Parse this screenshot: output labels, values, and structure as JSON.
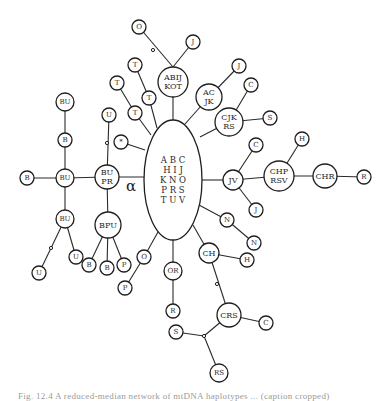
{
  "diagram": {
    "center": {
      "id": "center",
      "cx": 173,
      "cy": 180,
      "rx": 29,
      "ry": 60,
      "lines": [
        "A B C",
        "H I J",
        "K N O",
        "P R S",
        "T U V"
      ]
    },
    "alpha_label": {
      "text": "α",
      "x": 126,
      "y": 191
    },
    "nodes": [
      {
        "id": "abijkot",
        "x": 173,
        "y": 82,
        "r": 15,
        "label": [
          "ABIJ",
          "KOT"
        ]
      },
      {
        "id": "o_top",
        "x": 139,
        "y": 27,
        "r": 7,
        "label": [
          "O"
        ]
      },
      {
        "id": "j_top",
        "x": 193,
        "y": 42,
        "r": 7,
        "label": [
          "J"
        ]
      },
      {
        "id": "acjk",
        "x": 209,
        "y": 97,
        "r": 13,
        "label": [
          "AC",
          "JK"
        ]
      },
      {
        "id": "j_acjk",
        "x": 239,
        "y": 66,
        "r": 7,
        "label": [
          "J"
        ]
      },
      {
        "id": "cjkrs",
        "x": 229,
        "y": 122,
        "r": 14,
        "label": [
          "CJK",
          "RS"
        ]
      },
      {
        "id": "c_cjkrs",
        "x": 251,
        "y": 85,
        "r": 7,
        "label": [
          "C"
        ]
      },
      {
        "id": "s_cjkrs",
        "x": 270,
        "y": 118,
        "r": 7,
        "label": [
          "S"
        ]
      },
      {
        "id": "t1",
        "x": 135,
        "y": 65,
        "r": 7,
        "label": [
          "T"
        ]
      },
      {
        "id": "t2",
        "x": 117,
        "y": 83,
        "r": 7,
        "label": [
          "T"
        ]
      },
      {
        "id": "t3",
        "x": 149,
        "y": 98,
        "r": 7,
        "label": [
          "T"
        ]
      },
      {
        "id": "t4",
        "x": 135,
        "y": 113,
        "r": 7,
        "label": [
          "T"
        ]
      },
      {
        "id": "star",
        "x": 121,
        "y": 142,
        "r": 7,
        "label": [
          "*"
        ]
      },
      {
        "id": "bupr",
        "x": 107,
        "y": 177,
        "r": 12,
        "label": [
          "BU",
          "PR"
        ]
      },
      {
        "id": "u_bupr",
        "x": 109,
        "y": 115,
        "r": 7,
        "label": [
          "U"
        ]
      },
      {
        "id": "bu_mid",
        "x": 65,
        "y": 178,
        "r": 9,
        "label": [
          "BU"
        ]
      },
      {
        "id": "b_left",
        "x": 27,
        "y": 178,
        "r": 7,
        "label": [
          "B"
        ]
      },
      {
        "id": "b_up",
        "x": 65,
        "y": 140,
        "r": 7,
        "label": [
          "B"
        ]
      },
      {
        "id": "bu_top",
        "x": 65,
        "y": 102,
        "r": 9,
        "label": [
          "BU"
        ]
      },
      {
        "id": "bu_bot",
        "x": 65,
        "y": 219,
        "r": 9,
        "label": [
          "BU"
        ]
      },
      {
        "id": "u_bu1",
        "x": 76,
        "y": 257,
        "r": 7,
        "label": [
          "U"
        ]
      },
      {
        "id": "u_bu2",
        "x": 39,
        "y": 273,
        "r": 7,
        "label": [
          "U"
        ]
      },
      {
        "id": "bpu",
        "x": 108,
        "y": 225,
        "r": 13,
        "label": [
          "BPU"
        ]
      },
      {
        "id": "b_bpu1",
        "x": 89,
        "y": 265,
        "r": 7,
        "label": [
          "B"
        ]
      },
      {
        "id": "b_bpu2",
        "x": 107,
        "y": 268,
        "r": 7,
        "label": [
          "B"
        ]
      },
      {
        "id": "p_bpu",
        "x": 124,
        "y": 265,
        "r": 7,
        "label": [
          "P"
        ]
      },
      {
        "id": "o_low",
        "x": 144,
        "y": 257,
        "r": 7,
        "label": [
          "O"
        ]
      },
      {
        "id": "p_low",
        "x": 125,
        "y": 288,
        "r": 7,
        "label": [
          "P"
        ]
      },
      {
        "id": "or",
        "x": 173,
        "y": 271,
        "r": 9,
        "label": [
          "OR"
        ]
      },
      {
        "id": "r_or",
        "x": 173,
        "y": 311,
        "r": 7,
        "label": [
          "R"
        ]
      },
      {
        "id": "ch",
        "x": 209,
        "y": 253,
        "r": 10,
        "label": [
          "CH"
        ]
      },
      {
        "id": "h_ch",
        "x": 247,
        "y": 260,
        "r": 7,
        "label": [
          "H"
        ]
      },
      {
        "id": "crs",
        "x": 229,
        "y": 315,
        "r": 12,
        "label": [
          "CRS"
        ]
      },
      {
        "id": "c_crs",
        "x": 266,
        "y": 323,
        "r": 7,
        "label": [
          "C"
        ]
      },
      {
        "id": "s_crs",
        "x": 176,
        "y": 332,
        "r": 7,
        "label": [
          "S"
        ]
      },
      {
        "id": "rs_crs",
        "x": 219,
        "y": 373,
        "r": 9,
        "label": [
          "RS"
        ]
      },
      {
        "id": "n1",
        "x": 227,
        "y": 220,
        "r": 7,
        "label": [
          "N"
        ]
      },
      {
        "id": "n2",
        "x": 254,
        "y": 243,
        "r": 7,
        "label": [
          "N"
        ]
      },
      {
        "id": "jv",
        "x": 233,
        "y": 180,
        "r": 10,
        "label": [
          "JV"
        ]
      },
      {
        "id": "c_jv",
        "x": 256,
        "y": 145,
        "r": 7,
        "label": [
          "C"
        ]
      },
      {
        "id": "j_jv",
        "x": 256,
        "y": 210,
        "r": 7,
        "label": [
          "J"
        ]
      },
      {
        "id": "chprsv",
        "x": 279,
        "y": 176,
        "r": 15,
        "label": [
          "CHP",
          "RSV"
        ]
      },
      {
        "id": "h_chp",
        "x": 302,
        "y": 139,
        "r": 7,
        "label": [
          "H"
        ]
      },
      {
        "id": "chr",
        "x": 325,
        "y": 176,
        "r": 12,
        "label": [
          "CHR"
        ]
      },
      {
        "id": "r_chr",
        "x": 364,
        "y": 177,
        "r": 7,
        "label": [
          "R"
        ]
      }
    ],
    "edges": [
      [
        173,
        120,
        173,
        97
      ],
      [
        173,
        67,
        139,
        27
      ],
      [
        173,
        67,
        193,
        42
      ],
      [
        185,
        124,
        209,
        97
      ],
      [
        209,
        97,
        239,
        66
      ],
      [
        200,
        137,
        229,
        122
      ],
      [
        229,
        122,
        251,
        85
      ],
      [
        229,
        122,
        270,
        118
      ],
      [
        157,
        128,
        149,
        98
      ],
      [
        149,
        98,
        135,
        65
      ],
      [
        151,
        135,
        135,
        113
      ],
      [
        135,
        113,
        117,
        83
      ],
      [
        145,
        150,
        121,
        142
      ],
      [
        144,
        177,
        107,
        177
      ],
      [
        107,
        177,
        109,
        115
      ],
      [
        107,
        177,
        65,
        178
      ],
      [
        65,
        178,
        27,
        178
      ],
      [
        65,
        178,
        65,
        140
      ],
      [
        65,
        140,
        65,
        102
      ],
      [
        65,
        178,
        65,
        219
      ],
      [
        65,
        219,
        76,
        257
      ],
      [
        65,
        219,
        39,
        273
      ],
      [
        107,
        177,
        108,
        225
      ],
      [
        108,
        225,
        89,
        265
      ],
      [
        108,
        225,
        107,
        268
      ],
      [
        108,
        225,
        124,
        265
      ],
      [
        158,
        232,
        144,
        257
      ],
      [
        144,
        257,
        125,
        288
      ],
      [
        173,
        240,
        173,
        271
      ],
      [
        173,
        271,
        173,
        311
      ],
      [
        193,
        225,
        209,
        253
      ],
      [
        209,
        253,
        247,
        260
      ],
      [
        209,
        253,
        229,
        315
      ],
      [
        229,
        315,
        266,
        323
      ],
      [
        229,
        315,
        204,
        336
      ],
      [
        204,
        336,
        176,
        332
      ],
      [
        204,
        336,
        219,
        373
      ],
      [
        199,
        205,
        227,
        220
      ],
      [
        227,
        220,
        254,
        243
      ],
      [
        202,
        180,
        233,
        180
      ],
      [
        233,
        180,
        256,
        145
      ],
      [
        233,
        180,
        256,
        210
      ],
      [
        233,
        180,
        279,
        176
      ],
      [
        279,
        176,
        302,
        139
      ],
      [
        279,
        176,
        325,
        176
      ],
      [
        325,
        176,
        364,
        177
      ]
    ],
    "dots": [
      {
        "x": 153,
        "y": 50
      },
      {
        "x": 107,
        "y": 143
      },
      {
        "x": 51,
        "y": 248
      },
      {
        "x": 217,
        "y": 284
      },
      {
        "x": 204,
        "y": 336
      }
    ]
  },
  "caption": {
    "text": "Fig. 12.4  A reduced-median network of mtDNA haplotypes ... (caption cropped)"
  }
}
